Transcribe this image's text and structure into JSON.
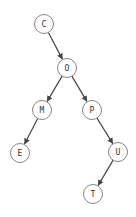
{
  "diagram": {
    "type": "binary-tree",
    "colors": {
      "background": "#ffffff",
      "node_stroke": "#777777",
      "node_fill": "#ffffff",
      "edge": "#444444",
      "label": "#333333"
    },
    "node_radius": 9.5,
    "nodes": [
      {
        "id": "C",
        "label": "C",
        "x": 44,
        "y": 24
      },
      {
        "id": "O",
        "label": "O",
        "x": 67,
        "y": 68
      },
      {
        "id": "M",
        "label": "M",
        "x": 42,
        "y": 110
      },
      {
        "id": "P",
        "label": "P",
        "x": 92,
        "y": 110
      },
      {
        "id": "E",
        "label": "E",
        "x": 20,
        "y": 153
      },
      {
        "id": "U",
        "label": "U",
        "x": 118,
        "y": 152
      },
      {
        "id": "T",
        "label": "T",
        "x": 93,
        "y": 194
      }
    ],
    "edges": [
      {
        "from": "C",
        "to": "O"
      },
      {
        "from": "O",
        "to": "M"
      },
      {
        "from": "O",
        "to": "P"
      },
      {
        "from": "M",
        "to": "E"
      },
      {
        "from": "P",
        "to": "U"
      },
      {
        "from": "U",
        "to": "T"
      }
    ]
  }
}
